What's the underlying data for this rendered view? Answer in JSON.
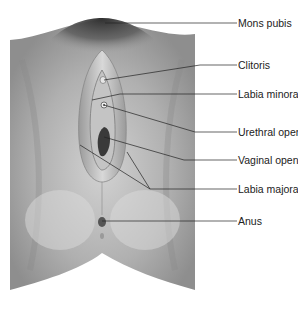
{
  "diagram": {
    "type": "anatomical-illustration",
    "labels": [
      {
        "text": "Mons pubis",
        "y": 23
      },
      {
        "text": "Clitoris",
        "y": 65
      },
      {
        "text": "Labia minora",
        "y": 94
      },
      {
        "text": "Urethral opening",
        "y": 132
      },
      {
        "text": "Vaginal opening",
        "y": 160
      },
      {
        "text": "Labia majora",
        "y": 189
      },
      {
        "text": "Anus",
        "y": 218
      }
    ],
    "colors": {
      "background": "#ffffff",
      "skin": "#a8a8a8",
      "skin_light": "#c8c8c8",
      "hair": "#3a3a3a",
      "leader_line": "#222222",
      "text": "#222222"
    }
  }
}
